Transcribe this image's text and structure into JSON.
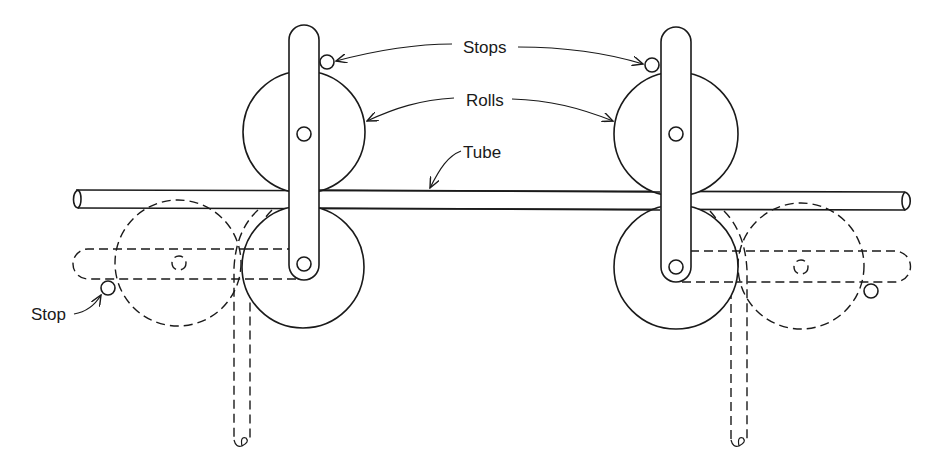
{
  "diagram": {
    "type": "mechanical-schematic",
    "labels": {
      "stops": "Stops",
      "rolls": "Rolls",
      "tube": "Tube",
      "stop": "Stop"
    },
    "components": [
      {
        "name": "tube",
        "style": "solid",
        "description": "Horizontal tube passing between rolls"
      },
      {
        "name": "upper-roll-left",
        "style": "solid"
      },
      {
        "name": "upper-roll-right",
        "style": "solid"
      },
      {
        "name": "lower-roll-left",
        "style": "solid"
      },
      {
        "name": "lower-roll-right",
        "style": "solid"
      },
      {
        "name": "arm-left",
        "style": "solid"
      },
      {
        "name": "arm-right",
        "style": "solid"
      },
      {
        "name": "stops-top",
        "style": "solid"
      },
      {
        "name": "swung-roll-left",
        "style": "dashed"
      },
      {
        "name": "swung-roll-right",
        "style": "dashed"
      },
      {
        "name": "swung-arm-left",
        "style": "dashed"
      },
      {
        "name": "swung-arm-right",
        "style": "dashed"
      },
      {
        "name": "bent-tube-left",
        "style": "dashed"
      },
      {
        "name": "bent-tube-right",
        "style": "dashed"
      },
      {
        "name": "stop-bottom-left",
        "style": "solid"
      },
      {
        "name": "stop-bottom-right",
        "style": "solid"
      }
    ]
  }
}
